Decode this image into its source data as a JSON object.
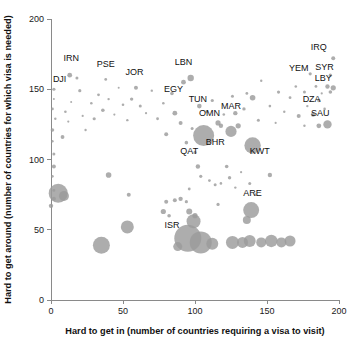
{
  "chart_data": {
    "type": "scatter",
    "title": "",
    "xlabel": "Hard to get in (number of countries requiring a visa to visit)",
    "ylabel": "Hard to get around (number of countries for which visa is needed)",
    "xlim": [
      0,
      200
    ],
    "ylim": [
      0,
      200
    ],
    "xticks": [
      0,
      50,
      100,
      150,
      200
    ],
    "yticks": [
      0,
      50,
      100,
      150,
      200
    ],
    "xtick_labels": [
      "0",
      "50",
      "100",
      "150",
      "200"
    ],
    "ytick_labels": [
      "0",
      "50",
      "100",
      "150",
      "200"
    ],
    "grid": false,
    "legend": "none",
    "bubble_color": "#9b9b9b",
    "size_note": "bubble area encodes a third variable (population / passport power)",
    "labeled_points": [
      {
        "label": "DJI",
        "x": 2,
        "y": 150,
        "r": 1.6,
        "lx": 6,
        "ly": 155
      },
      {
        "label": "IRN",
        "x": 13,
        "y": 160,
        "r": 2.4,
        "lx": 14,
        "ly": 170
      },
      {
        "label": "PSE",
        "x": 38,
        "y": 157,
        "r": 1.4,
        "lx": 38,
        "ly": 166
      },
      {
        "label": "JOR",
        "x": 59,
        "y": 151,
        "r": 2.0,
        "lx": 58,
        "ly": 160
      },
      {
        "label": "LBN",
        "x": 97,
        "y": 158,
        "r": 3.2,
        "lx": 92,
        "ly": 167
      },
      {
        "label": "EGY",
        "x": 84,
        "y": 147,
        "r": 1.8,
        "lx": 85,
        "ly": 148
      },
      {
        "label": "TUN",
        "x": 103,
        "y": 138,
        "r": 2.3,
        "lx": 102,
        "ly": 141
      },
      {
        "label": "OMN",
        "x": 116,
        "y": 126,
        "r": 2.6,
        "lx": 110,
        "ly": 131
      },
      {
        "label": "MAR",
        "x": 128,
        "y": 133,
        "r": 2.2,
        "lx": 125,
        "ly": 136
      },
      {
        "label": "QAT",
        "x": 106,
        "y": 117,
        "r": 10.5,
        "lx": 96,
        "ly": 104
      },
      {
        "label": "BHR",
        "x": 125,
        "y": 120,
        "r": 5.6,
        "lx": 114,
        "ly": 110
      },
      {
        "label": "KWT",
        "x": 140,
        "y": 110,
        "r": 8.2,
        "lx": 145,
        "ly": 104
      },
      {
        "label": "ARE",
        "x": 139,
        "y": 64,
        "r": 8.0,
        "lx": 140,
        "ly": 74
      },
      {
        "label": "ISR",
        "x": 95,
        "y": 44,
        "r": 13.5,
        "lx": 84,
        "ly": 51
      },
      {
        "label": "IRQ",
        "x": 196,
        "y": 172,
        "r": 2.0,
        "lx": 186,
        "ly": 178
      },
      {
        "label": "YEM",
        "x": 180,
        "y": 161,
        "r": 1.6,
        "lx": 172,
        "ly": 163
      },
      {
        "label": "SYR",
        "x": 194,
        "y": 160,
        "r": 1.7,
        "lx": 190,
        "ly": 164
      },
      {
        "label": "LBY",
        "x": 192,
        "y": 152,
        "r": 2.2,
        "lx": 189,
        "ly": 156
      },
      {
        "label": "DZA",
        "x": 186,
        "y": 142,
        "r": 1.8,
        "lx": 181,
        "ly": 141
      },
      {
        "label": "SAU",
        "x": 192,
        "y": 125,
        "r": 4.2,
        "lx": 187,
        "ly": 131
      }
    ],
    "unlabeled_points": [
      {
        "x": 1,
        "y": 136,
        "r": 1.4
      },
      {
        "x": 1,
        "y": 121,
        "r": 1.8
      },
      {
        "x": 2,
        "y": 143,
        "r": 1.0
      },
      {
        "x": 3,
        "y": 129,
        "r": 1.2
      },
      {
        "x": 1,
        "y": 113,
        "r": 1.2
      },
      {
        "x": 2,
        "y": 104,
        "r": 1.5
      },
      {
        "x": 2,
        "y": 95,
        "r": 2.0
      },
      {
        "x": 1,
        "y": 88,
        "r": 1.3
      },
      {
        "x": 0,
        "y": 67,
        "r": 2.2
      },
      {
        "x": 2,
        "y": 78,
        "r": 1.4
      },
      {
        "x": 8,
        "y": 116,
        "r": 1.9
      },
      {
        "x": 10,
        "y": 134,
        "r": 1.3
      },
      {
        "x": 12,
        "y": 127,
        "r": 1.1
      },
      {
        "x": 18,
        "y": 158,
        "r": 1.5
      },
      {
        "x": 14,
        "y": 141,
        "r": 1.0
      },
      {
        "x": 20,
        "y": 149,
        "r": 1.6
      },
      {
        "x": 22,
        "y": 131,
        "r": 1.1
      },
      {
        "x": 24,
        "y": 121,
        "r": 1.2
      },
      {
        "x": 28,
        "y": 140,
        "r": 1.3
      },
      {
        "x": 30,
        "y": 129,
        "r": 1.6
      },
      {
        "x": 33,
        "y": 146,
        "r": 1.4
      },
      {
        "x": 36,
        "y": 135,
        "r": 1.8
      },
      {
        "x": 40,
        "y": 143,
        "r": 1.2
      },
      {
        "x": 44,
        "y": 132,
        "r": 1.1
      },
      {
        "x": 47,
        "y": 151,
        "r": 1.0
      },
      {
        "x": 50,
        "y": 139,
        "r": 1.3
      },
      {
        "x": 53,
        "y": 128,
        "r": 1.2
      },
      {
        "x": 56,
        "y": 143,
        "r": 1.7
      },
      {
        "x": 62,
        "y": 138,
        "r": 1.5
      },
      {
        "x": 66,
        "y": 133,
        "r": 1.1
      },
      {
        "x": 70,
        "y": 149,
        "r": 1.2
      },
      {
        "x": 74,
        "y": 129,
        "r": 1.4
      },
      {
        "x": 78,
        "y": 140,
        "r": 1.3
      },
      {
        "x": 80,
        "y": 118,
        "r": 2.0
      },
      {
        "x": 86,
        "y": 133,
        "r": 2.4
      },
      {
        "x": 90,
        "y": 126,
        "r": 2.0
      },
      {
        "x": 92,
        "y": 155,
        "r": 2.4
      },
      {
        "x": 94,
        "y": 112,
        "r": 1.8
      },
      {
        "x": 98,
        "y": 122,
        "r": 1.5
      },
      {
        "x": 100,
        "y": 105,
        "r": 1.6
      },
      {
        "x": 108,
        "y": 134,
        "r": 1.4
      },
      {
        "x": 112,
        "y": 142,
        "r": 1.6
      },
      {
        "x": 118,
        "y": 124,
        "r": 2.2
      },
      {
        "x": 120,
        "y": 132,
        "r": 1.3
      },
      {
        "x": 122,
        "y": 95,
        "r": 1.8
      },
      {
        "x": 126,
        "y": 145,
        "r": 1.5
      },
      {
        "x": 130,
        "y": 124,
        "r": 2.6
      },
      {
        "x": 134,
        "y": 136,
        "r": 1.7
      },
      {
        "x": 136,
        "y": 147,
        "r": 1.4
      },
      {
        "x": 140,
        "y": 144,
        "r": 2.8
      },
      {
        "x": 144,
        "y": 128,
        "r": 1.5
      },
      {
        "x": 146,
        "y": 156,
        "r": 1.2
      },
      {
        "x": 152,
        "y": 138,
        "r": 1.3
      },
      {
        "x": 156,
        "y": 126,
        "r": 1.1
      },
      {
        "x": 158,
        "y": 148,
        "r": 1.6
      },
      {
        "x": 162,
        "y": 134,
        "r": 1.2
      },
      {
        "x": 166,
        "y": 144,
        "r": 1.4
      },
      {
        "x": 170,
        "y": 152,
        "r": 1.3
      },
      {
        "x": 172,
        "y": 131,
        "r": 2.0
      },
      {
        "x": 176,
        "y": 148,
        "r": 1.5
      },
      {
        "x": 178,
        "y": 138,
        "r": 1.2
      },
      {
        "x": 182,
        "y": 132,
        "r": 2.2
      },
      {
        "x": 184,
        "y": 152,
        "r": 1.4
      },
      {
        "x": 188,
        "y": 147,
        "r": 1.1
      },
      {
        "x": 190,
        "y": 136,
        "r": 1.3
      },
      {
        "x": 194,
        "y": 148,
        "r": 1.8
      },
      {
        "x": 196,
        "y": 151,
        "r": 2.6
      },
      {
        "x": 186,
        "y": 124,
        "r": 2.4
      },
      {
        "x": 176,
        "y": 124,
        "r": 1.2
      },
      {
        "x": 102,
        "y": 95,
        "r": 2.2
      },
      {
        "x": 104,
        "y": 88,
        "r": 1.6
      },
      {
        "x": 110,
        "y": 85,
        "r": 1.4
      },
      {
        "x": 114,
        "y": 82,
        "r": 1.5
      },
      {
        "x": 118,
        "y": 83,
        "r": 1.3
      },
      {
        "x": 124,
        "y": 87,
        "r": 1.7
      },
      {
        "x": 128,
        "y": 80,
        "r": 1.2
      },
      {
        "x": 132,
        "y": 91,
        "r": 1.1
      },
      {
        "x": 138,
        "y": 83,
        "r": 1.5
      },
      {
        "x": 142,
        "y": 75,
        "r": 1.3
      },
      {
        "x": 152,
        "y": 89,
        "r": 2.2
      },
      {
        "x": 116,
        "y": 68,
        "r": 1.6
      },
      {
        "x": 96,
        "y": 79,
        "r": 1.4
      },
      {
        "x": 86,
        "y": 71,
        "r": 2.0
      },
      {
        "x": 90,
        "y": 72,
        "r": 2.2
      },
      {
        "x": 94,
        "y": 70,
        "r": 1.6
      },
      {
        "x": 80,
        "y": 70,
        "r": 2.0
      },
      {
        "x": 78,
        "y": 63,
        "r": 2.6
      },
      {
        "x": 82,
        "y": 60,
        "r": 1.8
      },
      {
        "x": 54,
        "y": 75,
        "r": 2.0
      },
      {
        "x": 40,
        "y": 89,
        "r": 2.8
      },
      {
        "x": 5,
        "y": 76,
        "r": 9.5
      },
      {
        "x": 9,
        "y": 74,
        "r": 5.0
      },
      {
        "x": 2,
        "y": 72,
        "r": 2.0
      },
      {
        "x": 35,
        "y": 39,
        "r": 8.5
      },
      {
        "x": 53,
        "y": 52,
        "r": 6.5
      },
      {
        "x": 88,
        "y": 38,
        "r": 4.5
      },
      {
        "x": 99,
        "y": 56,
        "r": 7.0
      },
      {
        "x": 104,
        "y": 41,
        "r": 11.0
      },
      {
        "x": 112,
        "y": 40,
        "r": 6.0
      },
      {
        "x": 126,
        "y": 41,
        "r": 6.5
      },
      {
        "x": 133,
        "y": 41,
        "r": 5.5
      },
      {
        "x": 138,
        "y": 42,
        "r": 6.0
      },
      {
        "x": 146,
        "y": 41,
        "r": 5.0
      },
      {
        "x": 153,
        "y": 42,
        "r": 6.2
      },
      {
        "x": 160,
        "y": 41,
        "r": 5.0
      },
      {
        "x": 166,
        "y": 42,
        "r": 5.5
      },
      {
        "x": 136,
        "y": 57,
        "r": 4.0
      },
      {
        "x": 96,
        "y": 63,
        "r": 3.0
      },
      {
        "x": 100,
        "y": 60,
        "r": 2.6
      }
    ]
  }
}
